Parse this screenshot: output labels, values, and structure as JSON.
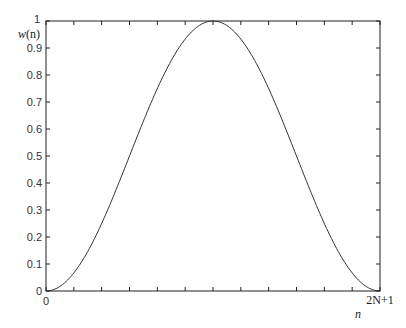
{
  "chart_data": {
    "type": "line",
    "title": "",
    "xlabel": "n",
    "ylabel": "w(n)",
    "xlim": [
      0,
      1
    ],
    "ylim": [
      0,
      1
    ],
    "grid": false,
    "x_tick_labels": {
      "start": "0",
      "end": "2N+1"
    },
    "x_tick_count": 13,
    "y_ticks": [
      0,
      0.1,
      0.2,
      0.3,
      0.4,
      0.5,
      0.6,
      0.7,
      0.8,
      0.9,
      1
    ],
    "y_tick_labels": [
      "0",
      "0.1",
      "0.2",
      "0.3",
      "0.4",
      "0.5",
      "0.6",
      "0.7",
      "0.8",
      "0.9",
      "1"
    ],
    "series": [
      {
        "name": "w(n)",
        "description": "raised cosine (Hann) window",
        "x": [
          0,
          0.05,
          0.1,
          0.15,
          0.2,
          0.25,
          0.3,
          0.35,
          0.4,
          0.45,
          0.5,
          0.55,
          0.6,
          0.65,
          0.7,
          0.75,
          0.8,
          0.85,
          0.9,
          0.95,
          1
        ],
        "values": [
          0,
          0.024,
          0.095,
          0.206,
          0.345,
          0.5,
          0.655,
          0.794,
          0.905,
          0.976,
          1,
          0.976,
          0.905,
          0.794,
          0.655,
          0.5,
          0.345,
          0.206,
          0.095,
          0.024,
          0
        ]
      }
    ]
  },
  "labels": {
    "ylabel_w": "w",
    "ylabel_paren": "(n)",
    "xlabel": "n",
    "x_start": "0",
    "x_end": "2N+1"
  },
  "colors": {
    "axis": "#222222",
    "line": "#333333"
  }
}
